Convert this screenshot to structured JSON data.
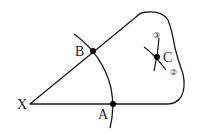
{
  "diagram": {
    "type": "geometric-construction",
    "colors": {
      "stroke": "#1a1a1a",
      "point": "#000000",
      "background": "#ffffff",
      "circled_num": "#666666"
    },
    "vertex": {
      "label": "X"
    },
    "points": [
      {
        "id": "A",
        "label": "A"
      },
      {
        "id": "B",
        "label": "B"
      },
      {
        "id": "C",
        "label": "C"
      }
    ],
    "arc_marks": [
      {
        "label": "③"
      },
      {
        "label": "②"
      }
    ]
  }
}
